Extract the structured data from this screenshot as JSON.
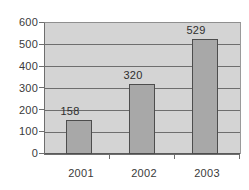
{
  "chart_data": {
    "type": "bar",
    "title": "",
    "subtitle": "",
    "xlabel": "",
    "ylabel": "",
    "categories": [
      "2001",
      "2002",
      "2003"
    ],
    "values": [
      158,
      320,
      529
    ],
    "data_labels": [
      "158",
      "320",
      "529"
    ],
    "ylim": [
      0,
      600
    ],
    "yticks": [
      0,
      100,
      200,
      300,
      400,
      500,
      600
    ],
    "ytick_labels": [
      "0",
      "100",
      "200",
      "300",
      "400",
      "500",
      "600"
    ],
    "grid": true,
    "grid_axis": "y",
    "legend": false,
    "legend_position": "none",
    "colors": {
      "bar_fill": "#a8a8a8",
      "bar_border": "#4d4d4d",
      "plot_background": "#d4d4d4",
      "page_background": "#ffffff",
      "gridline": "#6e6e6e",
      "axis": "#6e6e6e",
      "tick_label": "#3a3a3a",
      "data_label": "#2e2e2e"
    }
  }
}
